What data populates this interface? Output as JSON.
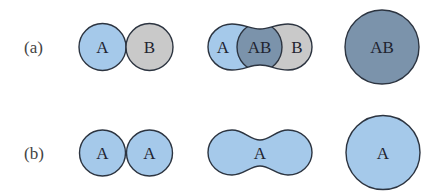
{
  "colors": {
    "particle_a": "#a5c9ea",
    "particle_b": "#c9c9c9",
    "bound_ab": "#7b93ab",
    "outline": "#2c3440"
  },
  "rows": [
    {
      "label": "(a)",
      "stages": [
        {
          "parts": [
            "A",
            "B"
          ],
          "description": "two separate circles touching"
        },
        {
          "parts": [
            "A",
            "AB",
            "B"
          ],
          "description": "merging peanut with overlapping AB region"
        },
        {
          "parts": [
            "AB"
          ],
          "description": "single large fused circle"
        }
      ]
    },
    {
      "label": "(b)",
      "stages": [
        {
          "parts": [
            "A",
            "A"
          ],
          "description": "two separate identical circles touching"
        },
        {
          "parts": [
            "A"
          ],
          "description": "merging peanut shape"
        },
        {
          "parts": [
            "A"
          ],
          "description": "single large fused circle"
        }
      ]
    }
  ]
}
